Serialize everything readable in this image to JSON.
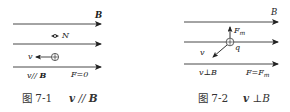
{
  "figures": [
    {
      "id": "fig-7-1",
      "field_label": "B",
      "neutral_label": "N",
      "velocity_label": "v",
      "condition_label": "v // B",
      "force_label": "F=0",
      "caption_number": "图 7-1",
      "caption_relation": "v // B",
      "parts": {
        "cond_v": "v",
        "cond_rel": "//",
        "cond_B": "B",
        "cap_v": "v",
        "cap_rel": "//",
        "cap_B": "B"
      }
    },
    {
      "id": "fig-7-2",
      "field_label": "B",
      "force_vector_label": "F",
      "force_vector_sub": "m",
      "charge_label": "q",
      "velocity_label": "v",
      "condition_label": "v ⊥ B",
      "force_label_main": "F=F",
      "force_label_sub": "m",
      "caption_number": "图 7-2",
      "caption_relation": "v ⊥ B",
      "parts": {
        "cond_v": "v",
        "cond_rel": "⊥",
        "cond_B": "B",
        "cap_v": "v",
        "cap_rel": "⊥",
        "cap_B": "B"
      }
    }
  ],
  "colors": {
    "ink": "#222222",
    "background": "#ffffff"
  }
}
